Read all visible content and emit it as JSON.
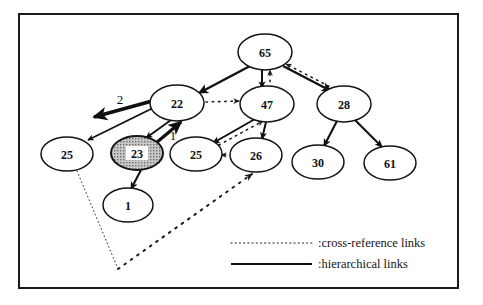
{
  "figure": {
    "frame": {
      "x": 19,
      "y": 14,
      "width": 439,
      "height": 274,
      "color": "#1a1a1a"
    },
    "background": "#ffffff"
  },
  "nodes": [
    {
      "id": "n65",
      "label": "65",
      "cx": 265,
      "cy": 52,
      "rx": 27,
      "ry": 18,
      "shaded": false
    },
    {
      "id": "n22",
      "label": "22",
      "cx": 177,
      "cy": 103,
      "rx": 27,
      "ry": 18,
      "shaded": false
    },
    {
      "id": "n47",
      "label": "47",
      "cx": 267,
      "cy": 104,
      "rx": 27,
      "ry": 18,
      "shaded": false
    },
    {
      "id": "n28",
      "label": "28",
      "cx": 344,
      "cy": 104,
      "rx": 27,
      "ry": 18,
      "shaded": false
    },
    {
      "id": "n25a",
      "label": "25",
      "cx": 67,
      "cy": 154,
      "rx": 26,
      "ry": 17,
      "shaded": false
    },
    {
      "id": "n23",
      "label": "23",
      "cx": 137,
      "cy": 153,
      "rx": 26,
      "ry": 17,
      "shaded": true
    },
    {
      "id": "n25b",
      "label": "25",
      "cx": 196,
      "cy": 154,
      "rx": 26,
      "ry": 17,
      "shaded": false
    },
    {
      "id": "n26",
      "label": "26",
      "cx": 256,
      "cy": 155,
      "rx": 26,
      "ry": 17,
      "shaded": false
    },
    {
      "id": "n30",
      "label": "30",
      "cx": 318,
      "cy": 162,
      "rx": 26,
      "ry": 17,
      "shaded": false
    },
    {
      "id": "n61",
      "label": "61",
      "cx": 390,
      "cy": 163,
      "rx": 26,
      "ry": 17,
      "shaded": false
    },
    {
      "id": "n1",
      "label": "1",
      "cx": 128,
      "cy": 205,
      "rx": 25,
      "ry": 17,
      "shaded": false
    }
  ],
  "edge_labels": [
    {
      "id": "lbl2",
      "text": "2",
      "x": 120,
      "y": 99
    },
    {
      "id": "lbl1",
      "text": "1",
      "x": 173,
      "y": 135
    }
  ],
  "hierarchical_edges": [
    {
      "id": "e65-22",
      "from": "65",
      "to": "22",
      "x1": 250,
      "y1": 66,
      "x2": 199,
      "y2": 93,
      "width": 2.4
    },
    {
      "id": "e65-47",
      "from": "65",
      "to": "47",
      "x1": 262,
      "y1": 70,
      "x2": 262,
      "y2": 88,
      "width": 2.0
    },
    {
      "id": "e65-28",
      "from": "65",
      "to": "28",
      "x1": 283,
      "y1": 66,
      "x2": 331,
      "y2": 91,
      "width": 2.4
    },
    {
      "id": "e22-25a",
      "from": "22",
      "to": "25",
      "x1": 155,
      "y1": 107,
      "x2": 88,
      "y2": 140,
      "width": 1.7
    },
    {
      "id": "e22-23",
      "from": "22",
      "to": "23",
      "x1": 171,
      "y1": 120,
      "x2": 146,
      "y2": 138,
      "width": 1.9
    },
    {
      "id": "e22-out",
      "from": "22",
      "to": "left",
      "x1": 163,
      "y1": 98,
      "x2": 94,
      "y2": 117,
      "width": 3.4
    },
    {
      "id": "e23-1",
      "from": "23",
      "to": "1",
      "x1": 141,
      "y1": 170,
      "x2": 131,
      "y2": 189,
      "width": 2.1
    },
    {
      "id": "e47-25b",
      "from": "47",
      "to": "25",
      "x1": 255,
      "y1": 119,
      "x2": 213,
      "y2": 143,
      "width": 2.0
    },
    {
      "id": "e47-26",
      "from": "47",
      "to": "26",
      "x1": 266,
      "y1": 122,
      "x2": 262,
      "y2": 139,
      "width": 2.0
    },
    {
      "id": "e28-30",
      "from": "28",
      "to": "30",
      "x1": 337,
      "y1": 121,
      "x2": 324,
      "y2": 146,
      "width": 2.1
    },
    {
      "id": "e28-61",
      "from": "28",
      "to": "61",
      "x1": 355,
      "y1": 120,
      "x2": 382,
      "y2": 147,
      "width": 2.1
    },
    {
      "id": "e-up-22",
      "from": "below",
      "to": "22",
      "x1": 156,
      "y1": 143,
      "x2": 181,
      "y2": 122,
      "width": 3.2
    }
  ],
  "cross_reference_edges": [
    {
      "id": "x22-47",
      "from": "22",
      "to": "47",
      "x1": 206,
      "y1": 102,
      "x2": 239,
      "y2": 101,
      "width": 1.6
    },
    {
      "id": "x47-65",
      "from": "47",
      "to": "65",
      "x1": 270,
      "y1": 88,
      "x2": 270,
      "y2": 70,
      "width": 1.6
    },
    {
      "id": "x28-65",
      "from": "28",
      "to": "65",
      "x1": 340,
      "y1": 92,
      "x2": 286,
      "y2": 64,
      "width": 1.6
    },
    {
      "id": "x26-47",
      "from": "26",
      "to": "47",
      "x1": 219,
      "y1": 145,
      "x2": 263,
      "y2": 121,
      "width": 1.6
    },
    {
      "id": "x26-25b",
      "from": "26",
      "to": "25",
      "x1": 232,
      "y1": 155,
      "x2": 221,
      "y2": 155,
      "width": 1.6
    },
    {
      "id": "x25a-pt",
      "from": "25",
      "to": "vertex",
      "x1": 77,
      "y1": 171,
      "x2": 118,
      "y2": 269,
      "width": 0.9
    },
    {
      "id": "xpt-26",
      "from": "vertex",
      "to": "26",
      "x1": 118,
      "y1": 269,
      "x2": 252,
      "y2": 174,
      "width": 2.0
    }
  ],
  "legend": {
    "items": [
      {
        "id": "legend-cross",
        "style": "dotted",
        "text": ":cross-reference links",
        "line_x1": 231,
        "line_x2": 312,
        "line_y": 243,
        "text_x": 318,
        "text_y": 243
      },
      {
        "id": "legend-hier",
        "style": "solid",
        "text": ":hierarchical links",
        "line_x1": 231,
        "line_x2": 312,
        "line_y": 264,
        "text_x": 318,
        "text_y": 264
      }
    ]
  },
  "styles": {
    "node_stroke": "#141414",
    "node_fill": "#ffffff",
    "shaded_fill": "#b8b8b8",
    "edge_color": "#101010",
    "dotted_color": "#1c1c1c"
  }
}
